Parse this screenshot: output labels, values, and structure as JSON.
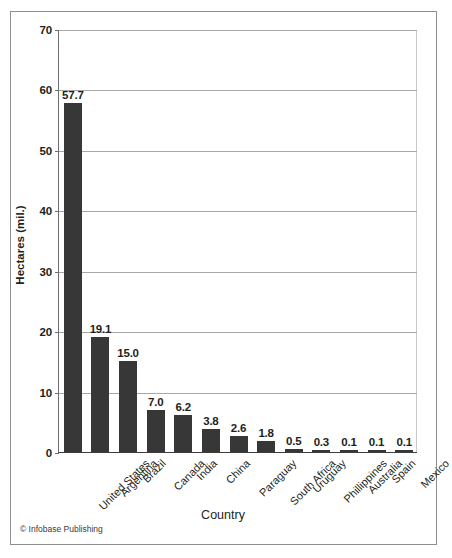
{
  "figure": {
    "credit": "© Infobase Publishing",
    "frame_color": "#8e8e8e",
    "background": "#ffffff"
  },
  "chart_data": {
    "type": "bar",
    "title": "",
    "subtitle": "",
    "xlabel": "Country",
    "ylabel": "Hectares (mil.)",
    "categories": [
      "United States",
      "Argentina",
      "Brazil",
      "Canada",
      "India",
      "China",
      "Paraguay",
      "South Africa",
      "Uruguay",
      "Phillippines",
      "Australia",
      "Spain",
      "Mexico"
    ],
    "values": [
      57.7,
      19.1,
      15.0,
      7.0,
      6.2,
      3.8,
      2.6,
      1.8,
      0.5,
      0.3,
      0.1,
      0.1,
      0.1
    ],
    "value_labels": [
      "57.7",
      "19.1",
      "15.0",
      "7.0",
      "6.2",
      "3.8",
      "2.6",
      "1.8",
      "0.5",
      "0.3",
      "0.1",
      "0.1",
      "0.1"
    ],
    "ylim": [
      0,
      70
    ],
    "ytick_values": [
      0,
      10,
      20,
      30,
      40,
      50,
      60,
      70
    ],
    "ytick_labels": [
      "0",
      "10",
      "20",
      "30",
      "40",
      "50",
      "60",
      "70"
    ],
    "grid": true,
    "grid_axis": "y",
    "legend": false,
    "legend_position": "none",
    "bar_color": "#373737",
    "gridline_color": "#a8a8a8",
    "axis_color": "#3d3d3d"
  }
}
